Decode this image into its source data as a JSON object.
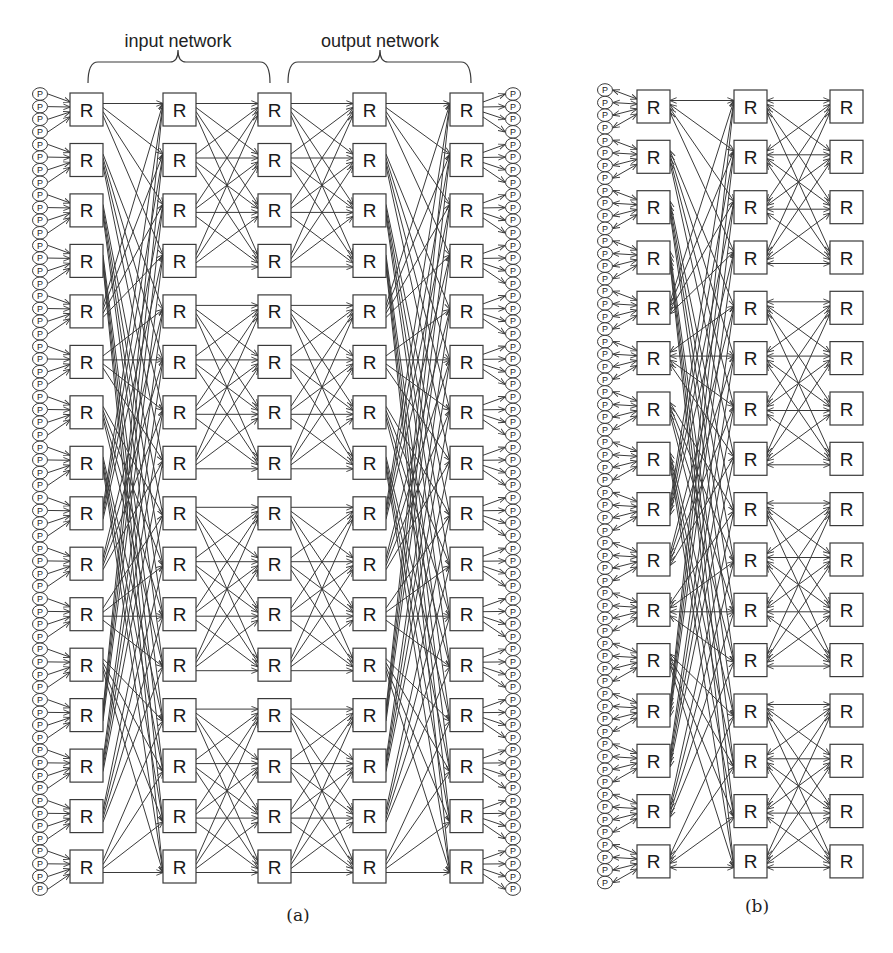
{
  "figure": {
    "panels": [
      {
        "id": "a",
        "caption": "(a)",
        "caption_pos": [
          298,
          921
        ],
        "brace_labels": [
          {
            "text": "input network",
            "center_x": 178,
            "y": 47,
            "brace": [
              88,
              270,
              178
            ]
          },
          {
            "text": "output network",
            "center_x": 380,
            "y": 47,
            "brace": [
              288,
              471,
              380
            ]
          }
        ],
        "router_label": "R",
        "node_label": "P",
        "rows": 16,
        "first_row_top": 93,
        "row_pitch": 50.47,
        "router_size": 33,
        "router_columns_x": [
          70,
          163,
          258,
          353,
          450
        ],
        "stages": [
          {
            "from": 0,
            "to": 1,
            "pattern": "stride4",
            "direction": "forward"
          },
          {
            "from": 1,
            "to": 2,
            "pattern": "block4",
            "direction": "forward"
          },
          {
            "from": 2,
            "to": 3,
            "pattern": "block4",
            "direction": "forward"
          },
          {
            "from": 3,
            "to": 4,
            "pattern": "stride4",
            "direction": "forward"
          }
        ],
        "left_nodes": {
          "count": 64,
          "center_x": 40,
          "first_y": 94,
          "pitch": 12.62,
          "direction": "to-router"
        },
        "right_nodes": {
          "count": 64,
          "center_x": 513,
          "first_y": 94,
          "pitch": 12.62,
          "direction": "from-router"
        }
      },
      {
        "id": "b",
        "caption": "(b)",
        "caption_pos": [
          757,
          912
        ],
        "brace_labels": [],
        "router_label": "R",
        "node_label": "P",
        "rows": 16,
        "first_row_top": 90,
        "row_pitch": 50.33,
        "router_size": 33,
        "router_columns_x": [
          637,
          734,
          830
        ],
        "stages": [
          {
            "from": 0,
            "to": 1,
            "pattern": "stride4",
            "direction": "bidirectional"
          },
          {
            "from": 1,
            "to": 2,
            "pattern": "block4",
            "direction": "bidirectional"
          }
        ],
        "left_nodes": {
          "count": 64,
          "center_x": 605,
          "first_y": 90,
          "pitch": 12.58,
          "direction": "bidirectional"
        },
        "right_nodes": null
      }
    ]
  },
  "colors": {
    "line": "#3a3a3a",
    "box_stroke": "#3a3a3a",
    "box_fill": "#ffffff",
    "text": "#1a1a1a"
  }
}
